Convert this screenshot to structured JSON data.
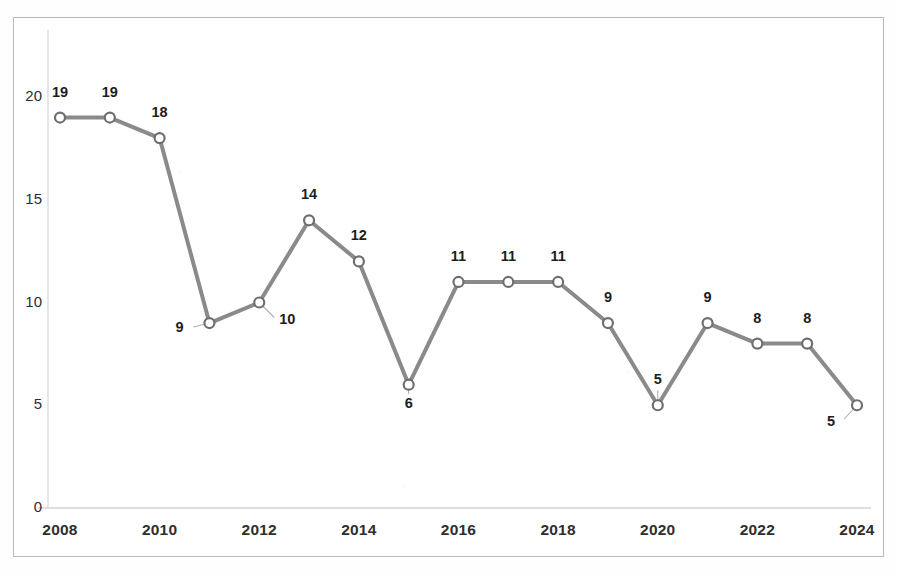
{
  "chart_data": {
    "type": "line",
    "title": "",
    "subtitle": "",
    "xlabel": "",
    "ylabel": "",
    "x": [
      2008,
      2009,
      2010,
      2011,
      2012,
      2013,
      2014,
      2015,
      2016,
      2017,
      2018,
      2019,
      2020,
      2021,
      2022,
      2023,
      2024
    ],
    "values": [
      19,
      19,
      18,
      9,
      10,
      14,
      12,
      6,
      11,
      11,
      11,
      9,
      5,
      9,
      8,
      8,
      5
    ],
    "point_labels": [
      "19",
      "19",
      "18",
      "9",
      "10",
      "14",
      "12",
      "6",
      "11",
      "11",
      "11",
      "9",
      "5",
      "9",
      "8",
      "8",
      "5"
    ],
    "label_positions": [
      "above",
      "above",
      "above",
      "left",
      "below-right",
      "above",
      "above",
      "below",
      "above",
      "above",
      "above",
      "above",
      "above",
      "above",
      "above",
      "above",
      "below-left"
    ],
    "xtick_labels": [
      "2008",
      "2010",
      "2012",
      "2014",
      "2016",
      "2018",
      "2020",
      "2022",
      "2024"
    ],
    "xtick_values": [
      2008,
      2010,
      2012,
      2014,
      2016,
      2018,
      2020,
      2022,
      2024
    ],
    "ytick_labels": [
      "0",
      "5",
      "10",
      "15",
      "20"
    ],
    "ytick_values": [
      0,
      5,
      10,
      15,
      20
    ],
    "ylim": [
      0,
      21
    ],
    "xlim": [
      2008,
      2024
    ],
    "grid": false,
    "legend": "none",
    "series_name": "",
    "colors": {
      "line": "#808080",
      "marker_stroke": "#6e6e6e",
      "marker_fill": "#ffffff",
      "axis": "#d5d5d5",
      "text": "#1d1d1d",
      "frame": "#b9b9b9",
      "background": "#ffffff"
    },
    "line_width": 4,
    "marker_size": 5
  }
}
